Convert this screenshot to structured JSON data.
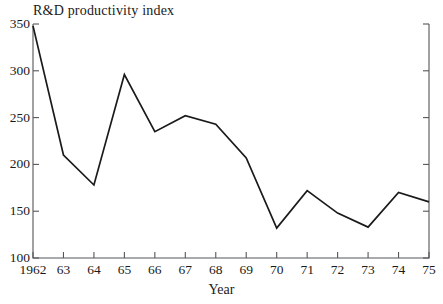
{
  "chart_data": {
    "type": "line",
    "title": "R&D productivity index",
    "xlabel": "Year",
    "ylabel": "",
    "categories": [
      "1962",
      "63",
      "64",
      "65",
      "66",
      "67",
      "68",
      "69",
      "70",
      "71",
      "72",
      "73",
      "74",
      "75"
    ],
    "x": [
      1962,
      1963,
      1964,
      1965,
      1966,
      1967,
      1968,
      1969,
      1970,
      1971,
      1972,
      1973,
      1974,
      1975
    ],
    "values": [
      348,
      210,
      178,
      296,
      235,
      252,
      243,
      207,
      132,
      172,
      148,
      133,
      170,
      160
    ],
    "series": [
      {
        "name": "R&D productivity index",
        "values": [
          348,
          210,
          178,
          296,
          235,
          252,
          243,
          207,
          132,
          172,
          148,
          133,
          170,
          160
        ]
      }
    ],
    "ylim": [
      100,
      350
    ],
    "xlim": [
      1962,
      1975
    ],
    "yticks": [
      100,
      150,
      200,
      250,
      300,
      350
    ],
    "ytick_labels": [
      "100",
      "150",
      "200",
      "250",
      "300",
      "350"
    ],
    "xtick_labels": [
      "1962",
      "63",
      "64",
      "65",
      "66",
      "67",
      "68",
      "69",
      "70",
      "71",
      "72",
      "73",
      "74",
      "75"
    ],
    "grid": false,
    "legend": null,
    "line_color": "#1a1a1a",
    "axis_color": "#55565a",
    "background_color": "#ffffff",
    "markers": false
  },
  "labels": {
    "title": "R&D productivity index",
    "xaxis_title": "Year"
  }
}
